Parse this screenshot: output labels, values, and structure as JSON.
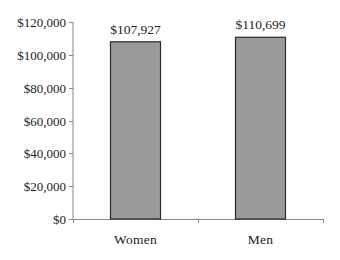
{
  "chart_data": {
    "type": "bar",
    "title": "",
    "xlabel": "",
    "ylabel": "",
    "categories": [
      "Women",
      "Men"
    ],
    "values": [
      107927,
      110699
    ],
    "value_labels": [
      "$107,927",
      "$110,699"
    ],
    "ylim": [
      0,
      120000
    ],
    "yticks": [
      0,
      20000,
      40000,
      60000,
      80000,
      100000,
      120000
    ],
    "ytick_labels": [
      "$0",
      "$20,000",
      "$40,000",
      "$60,000",
      "$80,000",
      "$100,000",
      "$120,000"
    ],
    "grid": false,
    "legend": null,
    "colors": {
      "bar_fill": "#9a9a9a",
      "bar_edge": "#2a2a2a",
      "axis": "#888888"
    }
  }
}
